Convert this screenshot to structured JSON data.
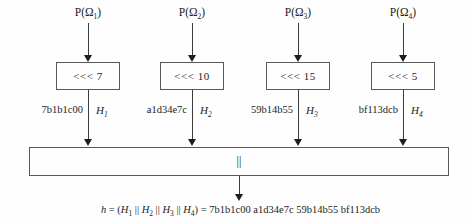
{
  "diagram": {
    "columns": [
      {
        "input_prefix": "P(Ω",
        "input_sub": "1",
        "input_suffix": ")",
        "rotation": "<<< 7",
        "hex": "7b1b1c00",
        "h_base": "H",
        "h_sub": "1"
      },
      {
        "input_prefix": "P(Ω",
        "input_sub": "2",
        "input_suffix": ")",
        "rotation": "<<< 10",
        "hex": "a1d34e7c",
        "h_base": "H",
        "h_sub": "2"
      },
      {
        "input_prefix": "P(Ω",
        "input_sub": "3",
        "input_suffix": ")",
        "rotation": "<<< 15",
        "hex": "59b14b55",
        "h_base": "H",
        "h_sub": "3"
      },
      {
        "input_prefix": "P(Ω",
        "input_sub": "4",
        "input_suffix": ")",
        "rotation": "<<< 5",
        "hex": "bf113dcb",
        "h_base": "H",
        "h_sub": "4"
      }
    ],
    "concat_label": "||",
    "formula": {
      "lhs_var": "h",
      "equals_open": " = (",
      "H": "H",
      "subs": [
        "1",
        "2",
        "3",
        "4"
      ],
      "sep": " || ",
      "close_equals": ") = ",
      "result": "7b1b1c00 a1d34e7c 59b14b55 bf113dcb"
    },
    "colors": {
      "line": "#3a3a3a",
      "text": "#1c1c1c",
      "background": "#fefefe"
    }
  }
}
